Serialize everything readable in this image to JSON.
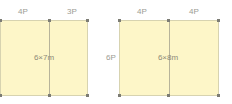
{
  "diagrams": [
    {
      "dimension_label": "6×7m",
      "top_labels": [
        "4P",
        "3P"
      ],
      "side_label": ""
    },
    {
      "dimension_label": "6×8m",
      "top_labels": [
        "4P",
        "4P"
      ],
      "side_label": "6P"
    }
  ],
  "colors": {
    "fill": "#fdf6c8",
    "line": "#b7b39a",
    "post": "#7c7c74",
    "text": "#9c9c94"
  }
}
